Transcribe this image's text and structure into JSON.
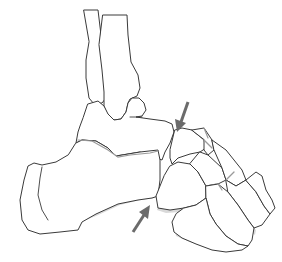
{
  "figure": {
    "title": "Lateral view of foot and ankle bones with arrows indicating the midtarsal joint",
    "view": "lateral",
    "side": "left foot (heel at left, toes at right)"
  },
  "colors": {
    "background": "#ffffff",
    "outline": "#3a3a3a",
    "shading": "#d9d9d9",
    "arrow": "#6b6b6b"
  },
  "bones": [
    {
      "id": "fibula",
      "name": "Fibula"
    },
    {
      "id": "tibia",
      "name": "Tibia"
    },
    {
      "id": "talus",
      "name": "Talus"
    },
    {
      "id": "calcaneus",
      "name": "Calcaneus"
    },
    {
      "id": "navicular",
      "name": "Navicular"
    },
    {
      "id": "cuboid",
      "name": "Cuboid"
    },
    {
      "id": "cuneiforms",
      "name": "Cuneiforms"
    },
    {
      "id": "metatarsals",
      "name": "Metatarsals"
    }
  ],
  "annotations": [
    {
      "id": "arrow-upper",
      "direction": "down-left",
      "points_to": "talonavicular joint"
    },
    {
      "id": "arrow-lower",
      "direction": "up-right",
      "points_to": "calcaneocuboid joint"
    }
  ]
}
